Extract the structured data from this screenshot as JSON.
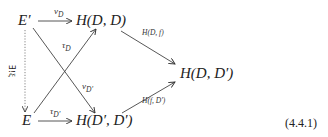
{
  "diagram": {
    "nodes": {
      "e_prime": "E′",
      "e": "E",
      "h_dd": "H(D, D)",
      "h_dpdp": "H(D′, D′)",
      "h_ddp": "H(D, D′)"
    },
    "arrows": {
      "nu_d": "ν",
      "nu_d_sub": "D",
      "tau_d": "τ",
      "tau_d_sub": "D",
      "nu_dp": "ν",
      "nu_dp_sub": "D′",
      "tau_dp": "τ",
      "tau_dp_sub": "D′",
      "h_d_f": "H(D, f)",
      "h_f_dp": "H(f, D′)",
      "exists_xi": "∃!ξ"
    },
    "equation_number": "(4.4.1)"
  }
}
